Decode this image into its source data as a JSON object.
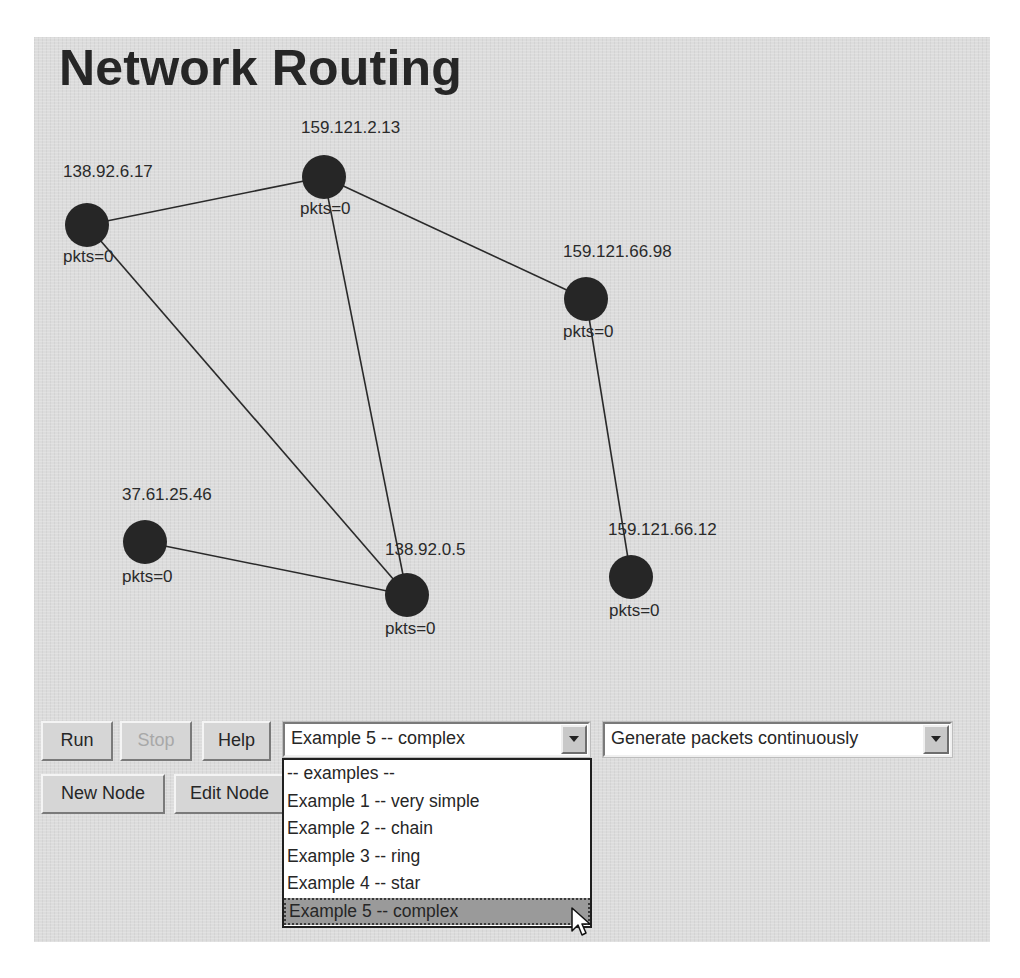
{
  "app": {
    "title": "Network Routing"
  },
  "graph": {
    "nodes": [
      {
        "id": "n1",
        "address": "138.92.6.17",
        "packets_label": "pkts=0",
        "x": 53,
        "y": 188
      },
      {
        "id": "n2",
        "address": "159.121.2.13",
        "packets_label": "pkts=0",
        "x": 290,
        "y": 140
      },
      {
        "id": "n3",
        "address": "159.121.66.98",
        "packets_label": "pkts=0",
        "x": 552,
        "y": 262
      },
      {
        "id": "n4",
        "address": "37.61.25.46",
        "packets_label": "pkts=0",
        "x": 111,
        "y": 505
      },
      {
        "id": "n5",
        "address": "138.92.0.5",
        "packets_label": "pkts=0",
        "x": 373,
        "y": 558
      },
      {
        "id": "n6",
        "address": "159.121.66.12",
        "packets_label": "pkts=0",
        "x": 597,
        "y": 540
      }
    ],
    "edges": [
      [
        "138.92.6.17",
        "159.121.2.13"
      ],
      [
        "159.121.2.13",
        "159.121.66.98"
      ],
      [
        "138.92.6.17",
        "138.92.0.5"
      ],
      [
        "159.121.2.13",
        "138.92.0.5"
      ],
      [
        "37.61.25.46",
        "138.92.0.5"
      ],
      [
        "159.121.66.98",
        "159.121.66.12"
      ]
    ],
    "node_color": "#262626",
    "edge_color": "#2a2a2a"
  },
  "toolbar": {
    "run_label": "Run",
    "stop_label": "Stop",
    "help_label": "Help",
    "new_node_label": "New Node",
    "edit_node_label": "Edit Node",
    "examples_combo": {
      "selected": "Example 5 -- complex",
      "open": true,
      "options": [
        "-- examples --",
        "Example 1 -- very simple",
        "Example 2 -- chain",
        "Example 3 -- ring",
        "Example 4 -- star",
        "Example 5 -- complex"
      ],
      "highlighted_index": 5
    },
    "packet_mode_combo": {
      "selected": "Generate packets continuously"
    }
  }
}
